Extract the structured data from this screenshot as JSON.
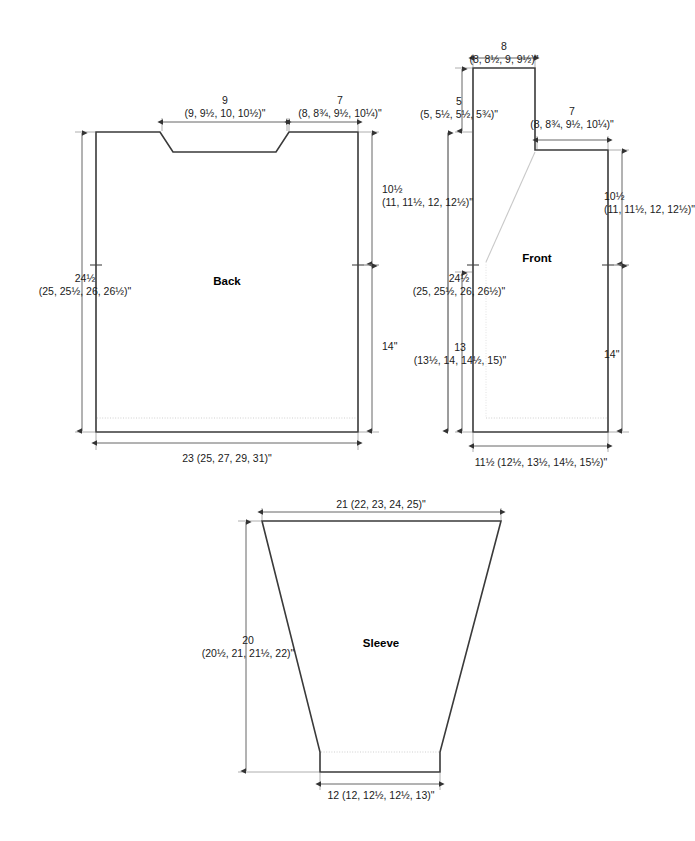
{
  "document": {
    "type": "knitting-pattern-schematic",
    "units": "inches",
    "sizes_note": "first size, then (sizes 2-5) in parentheses"
  },
  "pieces": {
    "back": {
      "label": "Back",
      "dims": {
        "neck_width": {
          "primary": "9",
          "range": "(9, 9½, 10, 10½)\""
        },
        "shoulder_width": {
          "primary": "7",
          "range": "(8, 8¾, 9½, 10¼)\""
        },
        "armhole_depth": {
          "primary": "10½",
          "range": "(11, 11½, 12, 12½)\""
        },
        "body_length": {
          "primary": "14\"",
          "range": ""
        },
        "total_length": {
          "primary": "24½",
          "range": "(25, 25½, 26, 26½)\""
        },
        "bottom_width": {
          "primary": "23 (25, 27, 29, 31)\"",
          "range": ""
        }
      }
    },
    "front": {
      "label": "Front",
      "dims": {
        "top_width": {
          "primary": "8",
          "range": "(8, 8½, 9, 9½)\""
        },
        "top_height": {
          "primary": "5",
          "range": "(5, 5½, 5½, 5¾)\""
        },
        "shoulder_width": {
          "primary": "7",
          "range": "(8, 8¾, 9½, 10¼)\""
        },
        "armhole_depth": {
          "primary": "10½",
          "range": "(11, 11½, 12, 12½)\""
        },
        "body_length": {
          "primary": "14\"",
          "range": ""
        },
        "total_length": {
          "primary": "24½",
          "range": "(25, 25½, 26, 26½)\""
        },
        "side_length": {
          "primary": "13",
          "range": "(13½, 14, 14½, 15)\""
        },
        "bottom_width": {
          "primary": "11½ (12½, 13½, 14½, 15½)\"",
          "range": ""
        }
      }
    },
    "sleeve": {
      "label": "Sleeve",
      "dims": {
        "top_width": {
          "primary": "21 (22, 23, 24, 25)\"",
          "range": ""
        },
        "length": {
          "primary": "20",
          "range": "(20½, 21, 21½, 22)\""
        },
        "cuff_width": {
          "primary": "12 (12, 12½, 12½, 13)\"",
          "range": ""
        }
      }
    }
  },
  "colors": {
    "outline": "#3a3a3a",
    "dimension_line": "#555555",
    "rib_line": "#cfcfcf",
    "text": "#1a1a1a",
    "background": "#ffffff"
  }
}
